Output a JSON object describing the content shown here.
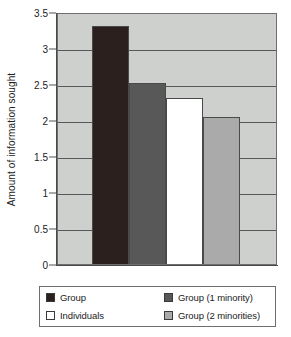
{
  "chart_data": {
    "type": "bar",
    "title": "",
    "xlabel": "",
    "ylabel": "Amount of information sought",
    "ylim": [
      0,
      3.5
    ],
    "ytick_values": [
      0,
      0.5,
      1,
      1.5,
      2,
      2.5,
      3,
      3.5
    ],
    "ytick_labels": [
      "0",
      "0.5",
      "1",
      "1.5",
      "2",
      "2.5",
      "3",
      "3.5"
    ],
    "grid": true,
    "grid_axis": "y",
    "legend_position": "below-plot",
    "categories": [
      "Group",
      "Group (1 minority)",
      "Individuals",
      "Group (2 minorities)"
    ],
    "values": [
      3.3,
      2.52,
      2.3,
      2.04
    ],
    "bars": [
      {
        "label": "Group",
        "value": 3.3,
        "color": "#2b201d"
      },
      {
        "label": "Group (1 minority)",
        "value": 2.52,
        "color": "#585858"
      },
      {
        "label": "Individuals",
        "value": 2.3,
        "color": "#ffffff"
      },
      {
        "label": "Group (2 minorities)",
        "value": 2.04,
        "color": "#a9aaa9"
      }
    ],
    "plot_background": "#cdd0cd",
    "gridline_color": "#56585a",
    "axis_color": "#4a4a4a"
  },
  "legend": {
    "entries": [
      {
        "label": "Group",
        "color": "#2b201d"
      },
      {
        "label": "Group (1 minority)",
        "color": "#585858"
      },
      {
        "label": "Individuals",
        "color": "#ffffff"
      },
      {
        "label": "Group (2 minorities)",
        "color": "#a9aaa9"
      }
    ]
  }
}
